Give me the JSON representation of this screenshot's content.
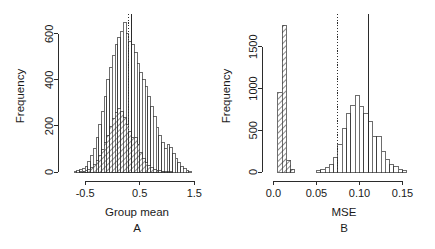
{
  "figure": {
    "width": 435,
    "height": 249,
    "background": "#ffffff",
    "ink_color": "#2b2b2b"
  },
  "chart_data": [
    {
      "type": "bar",
      "panel_id": "A",
      "panel_letter": "A",
      "title": "",
      "xlabel": "Group mean",
      "ylabel": "Frequency",
      "xlim": [
        -0.85,
        1.75
      ],
      "ylim": [
        0,
        660
      ],
      "xticks": [
        -0.5,
        0.5,
        1.5
      ],
      "xticklabels": [
        "-0.5",
        "0.5",
        "1.5"
      ],
      "yticks": [
        0,
        200,
        400,
        600
      ],
      "yticklabels": [
        "0",
        "200",
        "400",
        "600"
      ],
      "grid": false,
      "legend": "none",
      "bin_width": 0.05,
      "series": [
        {
          "name": "open-histogram",
          "style": "outline",
          "bin_starts": [
            -0.7,
            -0.65,
            -0.6,
            -0.55,
            -0.5,
            -0.45,
            -0.4,
            -0.35,
            -0.3,
            -0.25,
            -0.2,
            -0.15,
            -0.1,
            -0.05,
            0.0,
            0.05,
            0.1,
            0.15,
            0.2,
            0.25,
            0.3,
            0.35,
            0.4,
            0.45,
            0.5,
            0.55,
            0.6,
            0.65,
            0.7,
            0.75,
            0.8,
            0.85,
            0.9,
            0.95,
            1.0,
            1.05,
            1.1,
            1.15,
            1.2,
            1.25,
            1.3,
            1.35,
            1.4
          ],
          "values": [
            2,
            5,
            9,
            16,
            26,
            44,
            70,
            104,
            150,
            205,
            262,
            330,
            400,
            455,
            505,
            552,
            585,
            612,
            648,
            600,
            565,
            552,
            518,
            470,
            430,
            400,
            370,
            330,
            285,
            240,
            195,
            160,
            128,
            100,
            118,
            108,
            80,
            60,
            40,
            24,
            14,
            8,
            4
          ]
        },
        {
          "name": "hatched-histogram",
          "style": "hatched",
          "bin_starts": [
            -0.6,
            -0.55,
            -0.5,
            -0.45,
            -0.4,
            -0.35,
            -0.3,
            -0.25,
            -0.2,
            -0.15,
            -0.1,
            -0.05,
            0.0,
            0.05,
            0.1,
            0.15,
            0.2,
            0.25,
            0.3,
            0.35,
            0.4,
            0.45,
            0.5,
            0.55,
            0.6,
            0.65,
            0.7,
            0.75,
            0.8,
            0.85,
            0.9,
            0.95,
            1.0,
            1.05
          ],
          "values": [
            2,
            4,
            7,
            12,
            20,
            32,
            48,
            70,
            96,
            128,
            160,
            196,
            232,
            258,
            275,
            262,
            236,
            205,
            175,
            148,
            150,
            120,
            84,
            58,
            40,
            28,
            18,
            12,
            8,
            5,
            3,
            2,
            1,
            1
          ]
        }
      ],
      "reference_lines": [
        {
          "name": "dotted-reference-line",
          "x": 0.3,
          "style": "dotted"
        },
        {
          "name": "solid-reference-line",
          "x": 0.345,
          "style": "solid"
        }
      ]
    },
    {
      "type": "bar",
      "panel_id": "B",
      "panel_letter": "B",
      "title": "",
      "xlabel": "MSE",
      "ylabel": "Frequency",
      "xlim": [
        -0.004,
        0.168
      ],
      "ylim": [
        0,
        1820
      ],
      "xticks": [
        0.0,
        0.05,
        0.1,
        0.15
      ],
      "xticklabels": [
        "0.0",
        "0.05",
        "0.10",
        "0.15"
      ],
      "yticks": [
        0,
        500,
        1000,
        1500
      ],
      "yticklabels": [
        "0",
        "500",
        "1000",
        "1500"
      ],
      "grid": false,
      "legend": "none",
      "bin_width": 0.005,
      "series": [
        {
          "name": "hatched-histogram",
          "style": "hatched",
          "bin_starts": [
            0.005,
            0.01,
            0.015,
            0.02
          ],
          "values": [
            950,
            1760,
            140,
            30
          ]
        },
        {
          "name": "open-histogram",
          "style": "outline",
          "bin_starts": [
            0.05,
            0.055,
            0.06,
            0.065,
            0.07,
            0.075,
            0.08,
            0.085,
            0.09,
            0.095,
            0.1,
            0.105,
            0.11,
            0.115,
            0.12,
            0.125,
            0.13,
            0.135,
            0.14,
            0.145,
            0.15
          ],
          "values": [
            12,
            28,
            55,
            95,
            170,
            330,
            520,
            700,
            800,
            920,
            790,
            700,
            600,
            430,
            420,
            250,
            150,
            95,
            60,
            35,
            18
          ]
        }
      ],
      "reference_lines": [
        {
          "name": "dotted-reference-line",
          "x": 0.0745,
          "style": "dotted"
        },
        {
          "name": "solid-reference-line",
          "x": 0.1105,
          "style": "solid"
        }
      ]
    }
  ]
}
